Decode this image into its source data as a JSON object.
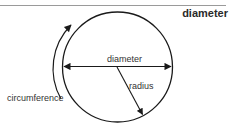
{
  "heading": "diameter",
  "labels": {
    "diameter": "diameter",
    "radius": "radius",
    "circumference": "circumference"
  },
  "colors": {
    "stroke": "#1a1a1a",
    "text": "#333333",
    "rule": "#9a9a9a"
  }
}
